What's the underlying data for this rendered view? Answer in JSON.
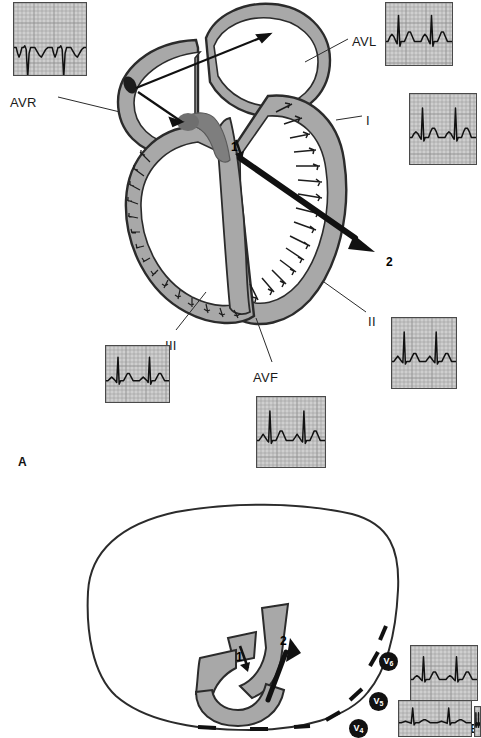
{
  "figure": {
    "panels": [
      {
        "id": "A",
        "label": "A",
        "label_pos": {
          "x": 18,
          "y": 455
        },
        "caption_type": "frontal-plane heart cross-section with limb lead ECG tracings"
      },
      {
        "id": "B",
        "label": "B",
        "label_pos": {
          "x": 468,
          "y": 726
        },
        "caption_type": "horizontal cross-section with precordial lead ECG tracings"
      }
    ],
    "vector_labels": [
      {
        "name": "1",
        "text": "1",
        "panel": "A",
        "x": 231,
        "y": 146,
        "meaning": "septal depolarization vector"
      },
      {
        "name": "2",
        "text": "2",
        "panel": "A",
        "x": 386,
        "y": 262,
        "meaning": "main ventricular depolarization vector"
      },
      {
        "name": "1",
        "text": "1",
        "panel": "B",
        "x": 245,
        "y": 657,
        "meaning": "septal depolarization vector"
      },
      {
        "name": "2",
        "text": "2",
        "panel": "B",
        "x": 286,
        "y": 642,
        "meaning": "main ventricular depolarization vector"
      }
    ],
    "lead_labels": [
      {
        "name": "AVR",
        "text": "AVR",
        "x": 10,
        "y": 95
      },
      {
        "name": "AVL",
        "text": "AVL",
        "x": 352,
        "y": 34
      },
      {
        "name": "I",
        "text": "I",
        "x": 366,
        "y": 113
      },
      {
        "name": "II",
        "text": "II",
        "x": 368,
        "y": 314
      },
      {
        "name": "III",
        "text": "III",
        "x": 165,
        "y": 338
      },
      {
        "name": "AVF",
        "text": "AVF",
        "x": 253,
        "y": 370
      }
    ],
    "precordial_tags": [
      {
        "name": "V6",
        "text": "V",
        "sub": "6",
        "x": 379,
        "y": 652
      },
      {
        "name": "V5",
        "text": "V",
        "sub": "5",
        "x": 369,
        "y": 692
      },
      {
        "name": "V4",
        "text": "V",
        "sub": "4",
        "x": 349,
        "y": 719
      }
    ],
    "colors": {
      "myocardium": "#a8a8a8",
      "myocardium_dark": "#8a8a8a",
      "outline": "#2b2b2b",
      "arrow": "#111111",
      "ecg_grid": "#8f8f8f",
      "ecg_paper": "#cfcfcf",
      "trace": "#111111",
      "text": "#1a1a1a",
      "tag_bg": "#111111",
      "tag_fg": "#ffffff"
    }
  },
  "chart_data": [
    {
      "type": "line",
      "name": "AVR",
      "title": "AVR",
      "x": [
        0,
        6,
        10,
        14,
        18,
        22,
        26,
        30,
        34,
        38,
        42,
        46,
        52,
        58,
        64,
        70,
        76,
        82,
        88,
        94,
        100
      ],
      "values": [
        0,
        0,
        -3,
        -5,
        -3,
        0,
        0,
        1,
        -1,
        -16,
        -3,
        0,
        0,
        0,
        -2,
        -4,
        -5,
        -3,
        -1,
        0,
        0
      ],
      "xlabel": "time",
      "ylabel": "mV",
      "grid": true,
      "note": "negative QRS, inverted P and T"
    },
    {
      "type": "line",
      "name": "AVL",
      "title": "AVL",
      "x": [
        0,
        6,
        12,
        18,
        24,
        30,
        34,
        38,
        42,
        46,
        50,
        56,
        62,
        68,
        74,
        80,
        86,
        92,
        100
      ],
      "values": [
        0,
        0,
        2,
        3,
        2,
        0,
        -1,
        11,
        -2,
        0,
        0,
        0,
        2,
        4,
        4,
        2,
        0,
        0,
        0
      ],
      "xlabel": "time",
      "ylabel": "mV",
      "grid": true,
      "note": "small upright QRS"
    },
    {
      "type": "line",
      "name": "I",
      "title": "I",
      "x": [
        0,
        6,
        12,
        18,
        24,
        30,
        34,
        38,
        42,
        46,
        50,
        56,
        62,
        68,
        74,
        80,
        86,
        92,
        100
      ],
      "values": [
        0,
        0,
        2,
        3,
        2,
        0,
        -1,
        16,
        -2,
        0,
        0,
        0,
        3,
        5,
        5,
        3,
        0,
        0,
        0
      ],
      "xlabel": "time",
      "ylabel": "mV",
      "grid": true,
      "note": "upright QRS with P and T waves"
    },
    {
      "type": "line",
      "name": "II",
      "title": "II",
      "x": [
        0,
        6,
        12,
        18,
        24,
        30,
        34,
        38,
        42,
        46,
        50,
        56,
        62,
        68,
        74,
        80,
        86,
        92,
        100
      ],
      "values": [
        0,
        0,
        2,
        4,
        2,
        0,
        -1,
        22,
        -2,
        0,
        0,
        0,
        3,
        6,
        6,
        3,
        0,
        0,
        0
      ],
      "xlabel": "time",
      "ylabel": "mV",
      "grid": true,
      "note": "tall upright R wave"
    },
    {
      "type": "line",
      "name": "III",
      "title": "III",
      "x": [
        0,
        6,
        12,
        18,
        24,
        30,
        34,
        38,
        42,
        46,
        50,
        56,
        62,
        68,
        74,
        80,
        86,
        92,
        100
      ],
      "values": [
        0,
        0,
        1,
        2,
        1,
        0,
        -1,
        13,
        -2,
        0,
        0,
        0,
        2,
        4,
        4,
        2,
        0,
        0,
        0
      ],
      "xlabel": "time",
      "ylabel": "mV",
      "grid": true,
      "note": "upright QRS, smaller amplitude"
    },
    {
      "type": "line",
      "name": "AVF",
      "title": "AVF",
      "x": [
        0,
        6,
        12,
        18,
        24,
        30,
        34,
        38,
        42,
        46,
        50,
        56,
        62,
        68,
        74,
        80,
        86,
        92,
        100
      ],
      "values": [
        0,
        0,
        2,
        4,
        2,
        0,
        -1,
        19,
        -2,
        0,
        0,
        0,
        3,
        6,
        6,
        3,
        0,
        0,
        0
      ],
      "xlabel": "time",
      "ylabel": "mV",
      "grid": true,
      "note": "upright QRS with prominent T"
    },
    {
      "type": "line",
      "name": "V6",
      "title": "V6",
      "x": [
        0,
        6,
        12,
        18,
        24,
        30,
        34,
        38,
        42,
        46,
        50,
        56,
        62,
        68,
        74,
        80,
        86,
        92,
        100
      ],
      "values": [
        0,
        0,
        2,
        3,
        2,
        0,
        -1,
        18,
        -2,
        0,
        0,
        0,
        3,
        6,
        6,
        3,
        0,
        0,
        0
      ],
      "xlabel": "time",
      "ylabel": "mV",
      "grid": true,
      "note": "upright R with T wave"
    },
    {
      "type": "line",
      "name": "V5",
      "title": "V5",
      "x": [
        0,
        6,
        12,
        18,
        24,
        30,
        34,
        38,
        42,
        46,
        50,
        56,
        62,
        68,
        74,
        80,
        86,
        92,
        100
      ],
      "values": [
        0,
        0,
        1,
        2,
        1,
        0,
        -1,
        20,
        -3,
        0,
        0,
        0,
        2,
        4,
        4,
        2,
        0,
        0,
        0
      ],
      "xlabel": "time",
      "ylabel": "mV",
      "grid": true,
      "note": "tall R wave"
    },
    {
      "type": "line",
      "name": "V4",
      "title": "V4",
      "x": [
        0,
        6,
        12,
        18,
        24,
        30,
        34,
        38,
        42,
        46,
        50,
        56,
        62,
        68,
        74,
        80,
        86,
        92,
        100
      ],
      "values": [
        0,
        0,
        1,
        2,
        1,
        0,
        -2,
        21,
        -4,
        0,
        0,
        0,
        2,
        4,
        4,
        2,
        0,
        0,
        0
      ],
      "xlabel": "time",
      "ylabel": "mV",
      "grid": true,
      "note": "tall R wave, partially cropped at image edge"
    }
  ],
  "ecg_boxes": [
    {
      "name": "ecg-avr",
      "series": "AVR",
      "x": 13,
      "y": 2,
      "w": 72,
      "h": 72
    },
    {
      "name": "ecg-avl",
      "series": "AVL",
      "x": 385,
      "y": 2,
      "w": 66,
      "h": 62
    },
    {
      "name": "ecg-i",
      "series": "I",
      "x": 409,
      "y": 93,
      "w": 66,
      "h": 70
    },
    {
      "name": "ecg-ii",
      "series": "II",
      "x": 391,
      "y": 317,
      "w": 64,
      "h": 70
    },
    {
      "name": "ecg-iii",
      "series": "III",
      "x": 105,
      "y": 345,
      "w": 63,
      "h": 56
    },
    {
      "name": "ecg-avf",
      "series": "AVF",
      "x": 256,
      "y": 396,
      "w": 68,
      "h": 70
    },
    {
      "name": "ecg-v6",
      "series": "V6",
      "x": 410,
      "y": 645,
      "w": 66,
      "h": 54
    },
    {
      "name": "ecg-v5",
      "series": "V5",
      "x": 398,
      "y": 700,
      "w": 72,
      "h": 35
    },
    {
      "name": "ecg-v4",
      "series": "V4",
      "x": 474,
      "y": 706,
      "w": 5,
      "h": 29
    }
  ]
}
